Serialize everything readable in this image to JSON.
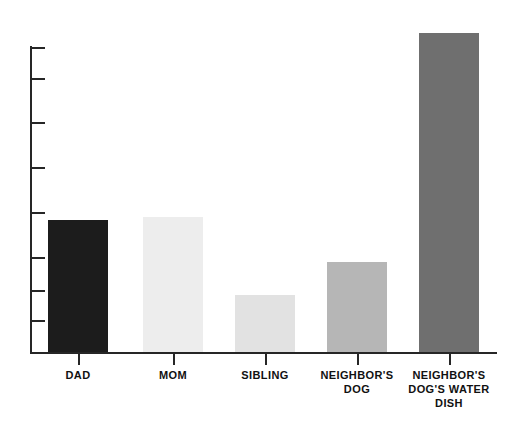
{
  "chart_data": {
    "type": "bar",
    "title": "",
    "subtitle": "",
    "xlabel": "",
    "ylabel": "",
    "categories": [
      "DAD",
      "MOM",
      "SIBLING",
      "NEIGHBOR'S\nDOG",
      "NEIGHBOR'S\nDOG'S WATER\nDISH"
    ],
    "values": [
      4.3,
      4.4,
      1.9,
      2.9,
      10.2
    ],
    "ylim": [
      0,
      10.8
    ],
    "y_tick_values": [
      10.8,
      9.7,
      8.2,
      6.6,
      5.0,
      3.4,
      2.2,
      1.1
    ],
    "grid": false,
    "legend": false,
    "bar_colors": [
      "#1c1c1c",
      "#ededed",
      "#e2e2e2",
      "#b6b6b6",
      "#6f6f6f"
    ],
    "axis_color": "#262626",
    "background_color": "#ffffff",
    "bar_width_px": 60,
    "annotations": []
  },
  "geometry": {
    "axis_left_px": 30,
    "axis_baseline_px": 352,
    "axis_top_px": 46,
    "y_ticks_px": [
      47,
      78,
      122,
      167,
      212,
      257,
      290,
      320
    ],
    "bars_px": [
      {
        "left": 48,
        "top": 220,
        "width": 60
      },
      {
        "left": 143,
        "top": 217,
        "width": 60
      },
      {
        "left": 235,
        "top": 295,
        "width": 60
      },
      {
        "left": 327,
        "top": 262,
        "width": 60
      },
      {
        "left": 419,
        "top": 33,
        "width": 60
      }
    ],
    "x_ticks_px": [
      78,
      173,
      265,
      357,
      449
    ],
    "label_centers_px": [
      78,
      173,
      265,
      357,
      449
    ]
  },
  "labels": {
    "cat0": "DAD",
    "cat1": "MOM",
    "cat2": "SIBLING",
    "cat3": "NEIGHBOR'S\nDOG",
    "cat4": "NEIGHBOR'S\nDOG'S WATER\nDISH"
  }
}
